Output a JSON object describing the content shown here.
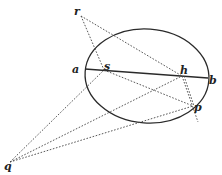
{
  "diagram": {
    "type": "geometric-construction",
    "shape": "ellipse",
    "ellipse": {
      "cx": 147,
      "cy": 76,
      "rx": 62,
      "ry": 47,
      "rotation": 4
    },
    "points": {
      "r": {
        "label": "r",
        "x": 81,
        "y": 16
      },
      "a": {
        "label": "a",
        "x": 85,
        "y": 69
      },
      "s": {
        "label": "s",
        "x": 104,
        "y": 70
      },
      "h": {
        "label": "h",
        "x": 182,
        "y": 76
      },
      "b": {
        "label": "b",
        "x": 208,
        "y": 78
      },
      "p": {
        "label": "p",
        "x": 193,
        "y": 106
      },
      "q": {
        "label": "q",
        "x": 10,
        "y": 162
      }
    },
    "segments": [
      {
        "from": "a",
        "to": "b",
        "style": "solid"
      },
      {
        "from": "r",
        "to": "s",
        "style": "dotted"
      },
      {
        "from": "r",
        "to": "h",
        "style": "dotted"
      },
      {
        "from": "s",
        "to": "p",
        "style": "dotted"
      },
      {
        "from": "h",
        "to": "p",
        "style": "dotted"
      },
      {
        "from": "q",
        "to": "s",
        "style": "dotted"
      },
      {
        "from": "q",
        "to": "h",
        "style": "dotted"
      },
      {
        "from": "q",
        "to": "p",
        "style": "dotted"
      }
    ]
  },
  "labels": {
    "r": "r",
    "a": "a",
    "s": "s",
    "h": "h",
    "b": "b",
    "p": "p",
    "q": "q"
  }
}
